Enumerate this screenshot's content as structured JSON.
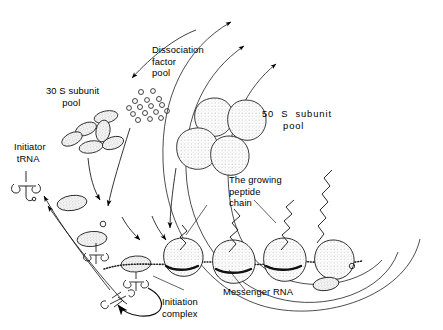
{
  "figure": {
    "background_color": "#ffffff",
    "ink_color": "#000000",
    "stipple_fill": "#d9d9d9"
  },
  "labels": {
    "dissociation_factor_pool": "Dissociation\nfactor\npool",
    "subunit_30s_pool": "30 S subunit\n      pool",
    "subunit_50s_pool": "50  S  subunit\n      pool",
    "initiator_trna": "Initiator\n tRNA",
    "growing_peptide_chain": "The growing\npeptide\nchain",
    "messenger_rna": "Messenger RNA",
    "initiation_complex": "Initiation\ncomplex"
  },
  "elements": {
    "dissociation_factors": {
      "name": "dissociation-factor-particles",
      "count": 16,
      "shape": "small open circle",
      "points": [
        [
          141,
          92
        ],
        [
          153,
          91
        ],
        [
          135,
          101
        ],
        [
          147,
          100
        ],
        [
          159,
          99
        ],
        [
          129,
          108
        ],
        [
          140,
          107
        ],
        [
          151,
          106
        ],
        [
          162,
          105
        ],
        [
          133,
          114
        ],
        [
          145,
          113
        ],
        [
          156,
          112
        ],
        [
          167,
          111
        ],
        [
          138,
          120
        ],
        [
          150,
          119
        ],
        [
          161,
          118
        ]
      ]
    },
    "subunits_30s": {
      "name": "30s-subunit-pool",
      "count": 6,
      "shape": "small stippled ellipse",
      "items": [
        {
          "cx": 106,
          "cy": 117,
          "rx": 12,
          "ry": 6,
          "rot": -12
        },
        {
          "cx": 86,
          "cy": 129,
          "rx": 11,
          "ry": 6,
          "rot": -20
        },
        {
          "cx": 103,
          "cy": 131,
          "rx": 7,
          "ry": 11,
          "rot": 8
        },
        {
          "cx": 72,
          "cy": 138,
          "rx": 11,
          "ry": 6,
          "rot": -25
        },
        {
          "cx": 90,
          "cy": 146,
          "rx": 12,
          "ry": 6,
          "rot": -10
        },
        {
          "cx": 112,
          "cy": 143,
          "rx": 11,
          "ry": 6,
          "rot": -18
        }
      ]
    },
    "subunits_50s": {
      "name": "50s-subunit-pool",
      "count": 4,
      "shape": "large stippled blob",
      "items": [
        {
          "cx": 213,
          "cy": 117,
          "r": 20
        },
        {
          "cx": 245,
          "cy": 120,
          "r": 21
        },
        {
          "cx": 196,
          "cy": 148,
          "r": 21
        },
        {
          "cx": 228,
          "cy": 155,
          "r": 20
        }
      ]
    },
    "messenger_rna": {
      "name": "mrna-strand",
      "style": "beaded dotted strand",
      "path": "M108,268 C140,258 170,266 200,262 C232,258 260,266 292,262 C320,258 340,266 360,262"
    },
    "translating_ribosomes": {
      "name": "translating-ribosome",
      "count": 3,
      "items": [
        {
          "cx": 182,
          "cy": 255,
          "r": 17,
          "peptide": "short"
        },
        {
          "cx": 232,
          "cy": 258,
          "r": 19,
          "peptide": "medium"
        },
        {
          "cx": 283,
          "cy": 256,
          "r": 19,
          "peptide": "long"
        }
      ]
    },
    "free_peptide_chain": {
      "name": "released-peptide-chain",
      "style": "zigzag",
      "turns": 9
    },
    "terminating_ribosome": {
      "name": "terminating-50s-subunit",
      "cx": 332,
      "cy": 258,
      "r": 18
    },
    "released_30s": {
      "name": "released-30s-subunit",
      "cx": 326,
      "cy": 283,
      "rx": 13,
      "ry": 6
    },
    "released_factor": {
      "name": "released-dissociation-factor",
      "cx": 352,
      "cy": 266,
      "r": 2.6
    },
    "initiator_trna_glyph": {
      "name": "initiator-trna-cloverleaf",
      "x": 30,
      "y": 175
    },
    "released_trna_glyph": {
      "name": "released-trna-cloverleaf",
      "x": 112,
      "y": 288
    },
    "recycling_arcs": {
      "name": "recycling-arcs",
      "count": 3,
      "description": "three nested arcs returning subunits and factor to the pools"
    }
  }
}
